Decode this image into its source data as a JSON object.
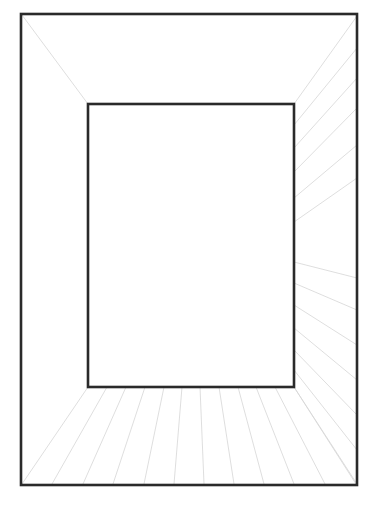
{
  "diagram": {
    "type": "one-point-perspective-room",
    "background": "#ffffff",
    "colors": {
      "frame": "#2a2a2a",
      "guide": "#d6d6d6"
    },
    "outer_rect": {
      "x1": 21,
      "y1": 14,
      "x2": 357,
      "y2": 485
    },
    "inner_rect": {
      "x1": 88,
      "y1": 104,
      "x2": 294,
      "y2": 387
    },
    "ceiling_diagonals": [
      {
        "x1": 22,
        "y1": 15,
        "x2": 88,
        "y2": 104
      }
    ],
    "right_wall_guides": [
      {
        "x1": 294,
        "y1": 104,
        "x2": 357,
        "y2": 16
      },
      {
        "x1": 294,
        "y1": 125,
        "x2": 357,
        "y2": 48
      },
      {
        "x1": 294,
        "y1": 148,
        "x2": 357,
        "y2": 78
      },
      {
        "x1": 294,
        "y1": 172,
        "x2": 357,
        "y2": 108
      },
      {
        "x1": 294,
        "y1": 198,
        "x2": 357,
        "y2": 145
      },
      {
        "x1": 294,
        "y1": 222,
        "x2": 357,
        "y2": 178
      },
      {
        "x1": 294,
        "y1": 262,
        "x2": 357,
        "y2": 278
      },
      {
        "x1": 294,
        "y1": 283,
        "x2": 357,
        "y2": 310
      },
      {
        "x1": 294,
        "y1": 305,
        "x2": 357,
        "y2": 345
      },
      {
        "x1": 294,
        "y1": 328,
        "x2": 357,
        "y2": 380
      },
      {
        "x1": 294,
        "y1": 350,
        "x2": 357,
        "y2": 415
      },
      {
        "x1": 294,
        "y1": 370,
        "x2": 357,
        "y2": 450
      },
      {
        "x1": 294,
        "y1": 387,
        "x2": 357,
        "y2": 484
      }
    ],
    "floor_guides": [
      {
        "x1": 88,
        "y1": 387,
        "x2": 22,
        "y2": 484
      },
      {
        "x1": 107,
        "y1": 387,
        "x2": 52,
        "y2": 484
      },
      {
        "x1": 126,
        "y1": 387,
        "x2": 83,
        "y2": 484
      },
      {
        "x1": 145,
        "y1": 387,
        "x2": 113,
        "y2": 484
      },
      {
        "x1": 164,
        "y1": 387,
        "x2": 144,
        "y2": 484
      },
      {
        "x1": 182,
        "y1": 387,
        "x2": 174,
        "y2": 484
      },
      {
        "x1": 200,
        "y1": 387,
        "x2": 204,
        "y2": 484
      },
      {
        "x1": 219,
        "y1": 387,
        "x2": 234,
        "y2": 484
      },
      {
        "x1": 238,
        "y1": 387,
        "x2": 264,
        "y2": 484
      },
      {
        "x1": 256,
        "y1": 387,
        "x2": 294,
        "y2": 484
      },
      {
        "x1": 275,
        "y1": 387,
        "x2": 325,
        "y2": 484
      },
      {
        "x1": 294,
        "y1": 387,
        "x2": 356,
        "y2": 484
      }
    ]
  }
}
